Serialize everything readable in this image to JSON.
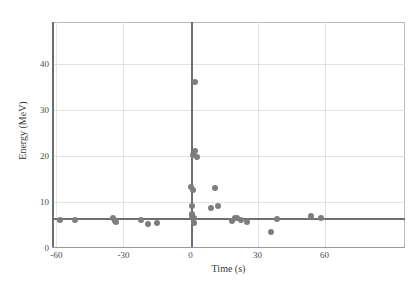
{
  "chart_data": {
    "type": "scatter",
    "title": "",
    "xlabel": "Time (s)",
    "ylabel": "Energy (MeV)",
    "xlim": [
      -62,
      96
    ],
    "ylim": [
      0,
      49
    ],
    "xticks": [
      -60,
      -30,
      0,
      30,
      60
    ],
    "xtick_labels": [
      "-60",
      "-30",
      "0",
      "30",
      "60"
    ],
    "yticks": [
      0,
      10,
      20,
      30,
      40
    ],
    "ytick_labels": [
      "0",
      "10",
      "20",
      "30",
      "40"
    ],
    "grid": true,
    "legend": "none",
    "point_color": "#7d7d7d",
    "grid_color": "#e2e2e2",
    "axis_color": "#6e6e6e",
    "reference_lines": [
      {
        "orientation": "horizontal",
        "value": 6.6,
        "color": "#6f6f6f"
      },
      {
        "orientation": "vertical",
        "value": 0,
        "color": "#6f6f6f"
      }
    ],
    "series": [
      {
        "name": "events",
        "points": [
          {
            "x": -58.5,
            "y": 6.1
          },
          {
            "x": -51.5,
            "y": 6.0
          },
          {
            "x": -34.5,
            "y": 6.4
          },
          {
            "x": -34.0,
            "y": 5.9
          },
          {
            "x": -33.5,
            "y": 5.6
          },
          {
            "x": -22.0,
            "y": 6.0
          },
          {
            "x": -19.0,
            "y": 5.2
          },
          {
            "x": -15.0,
            "y": 5.4
          },
          {
            "x": 0.3,
            "y": 13.3
          },
          {
            "x": 0.5,
            "y": 9.2
          },
          {
            "x": 0.6,
            "y": 7.4
          },
          {
            "x": 0.8,
            "y": 6.9
          },
          {
            "x": 1.0,
            "y": 20.2
          },
          {
            "x": 1.2,
            "y": 12.5
          },
          {
            "x": 1.4,
            "y": 6.5
          },
          {
            "x": 1.6,
            "y": 5.4
          },
          {
            "x": 2.0,
            "y": 36.0
          },
          {
            "x": 2.2,
            "y": 21.0
          },
          {
            "x": 3.0,
            "y": 19.7
          },
          {
            "x": 9.0,
            "y": 8.6
          },
          {
            "x": 11.0,
            "y": 13.0
          },
          {
            "x": 12.5,
            "y": 9.1
          },
          {
            "x": 18.5,
            "y": 5.8
          },
          {
            "x": 20.0,
            "y": 6.6
          },
          {
            "x": 21.0,
            "y": 6.5
          },
          {
            "x": 22.5,
            "y": 6.0
          },
          {
            "x": 25.5,
            "y": 5.6
          },
          {
            "x": 36.0,
            "y": 3.5
          },
          {
            "x": 38.5,
            "y": 6.2
          },
          {
            "x": 54.0,
            "y": 7.0
          },
          {
            "x": 58.5,
            "y": 6.6
          }
        ]
      }
    ]
  }
}
